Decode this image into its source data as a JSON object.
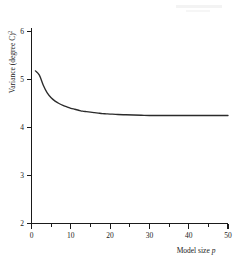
{
  "chart_data": {
    "type": "line",
    "title": "",
    "xlabel": "Model size p",
    "xlabel_text": "Model size",
    "xlabel_symbol": "p",
    "ylabel": "Variance (degree C)²",
    "ylabel_text": "Variance (degree C)",
    "ylabel_exponent": "2",
    "xlim": [
      0,
      50
    ],
    "ylim": [
      2,
      6
    ],
    "grid": false,
    "legend": null,
    "x_ticks": [
      0,
      10,
      20,
      30,
      40,
      50
    ],
    "x_tick_labels": [
      "0",
      "10",
      "20",
      "30",
      "40",
      "50"
    ],
    "x_minor_ticks": [
      5,
      15,
      25,
      35,
      45
    ],
    "y_ticks": [
      2,
      3,
      4,
      5,
      6
    ],
    "y_tick_labels": [
      "2",
      "3",
      "4",
      "5",
      "6"
    ],
    "series": [
      {
        "name": "variance",
        "x": [
          1,
          2,
          3,
          4,
          5,
          6,
          7,
          8,
          9,
          10,
          11,
          12,
          13,
          14,
          15,
          16,
          17,
          18,
          19,
          20,
          22,
          24,
          26,
          28,
          30,
          33,
          36,
          39,
          42,
          45,
          48,
          50
        ],
        "values": [
          5.18,
          5.09,
          4.88,
          4.72,
          4.62,
          4.55,
          4.5,
          4.46,
          4.43,
          4.4,
          4.38,
          4.36,
          4.34,
          4.33,
          4.32,
          4.31,
          4.3,
          4.29,
          4.285,
          4.28,
          4.27,
          4.265,
          4.26,
          4.255,
          4.25,
          4.25,
          4.25,
          4.25,
          4.25,
          4.25,
          4.25,
          4.25
        ]
      }
    ]
  },
  "figure": {
    "caption": ""
  }
}
